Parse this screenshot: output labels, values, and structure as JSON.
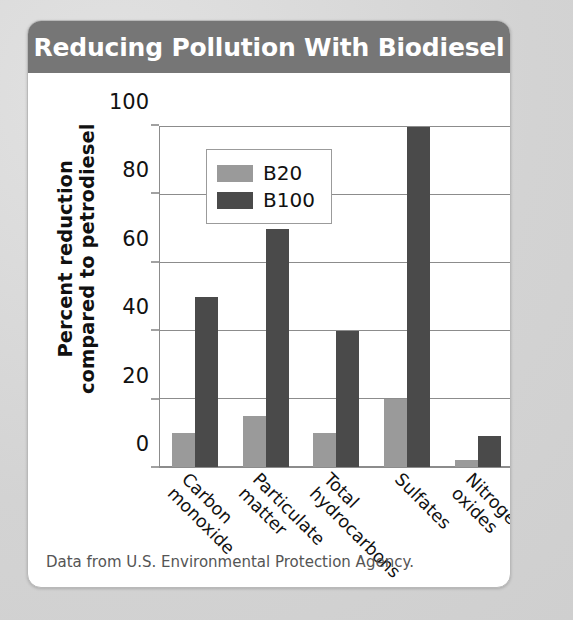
{
  "card": {
    "title": "Reducing Pollution With Biodiesel",
    "header_color": "#767676",
    "background_color": "#ffffff",
    "source_note": "Data from U.S. Environmental Protection Agency."
  },
  "legend": {
    "entries": [
      {
        "label": "B20",
        "color": "#9a9a9a"
      },
      {
        "label": "B100",
        "color": "#4a4a4a"
      }
    ]
  },
  "axes": {
    "y_title": "Percent reduction\ncompared to petrodiesel",
    "y_ticks": [
      "0",
      "20",
      "40",
      "60",
      "80",
      "100"
    ]
  },
  "chart_data": {
    "type": "bar",
    "title": "Reducing Pollution With Biodiesel",
    "xlabel": "",
    "ylabel": "Percent reduction compared to petrodiesel",
    "ylim": [
      0,
      100
    ],
    "yticks": [
      0,
      20,
      40,
      60,
      80,
      100
    ],
    "grid": true,
    "legend_position": "inside-top-left",
    "categories": [
      "Carbon\nmonoxide",
      "Particulate\nmatter",
      "Total\nhydrocarbons",
      "Sulfates",
      "Nitrogen\noxides"
    ],
    "series": [
      {
        "name": "B20",
        "color": "#9a9a9a",
        "values": [
          10,
          15,
          10,
          20,
          2
        ]
      },
      {
        "name": "B100",
        "color": "#4a4a4a",
        "values": [
          50,
          70,
          40,
          100,
          9
        ]
      }
    ],
    "annotation": "Data from U.S. Environmental Protection Agency."
  }
}
